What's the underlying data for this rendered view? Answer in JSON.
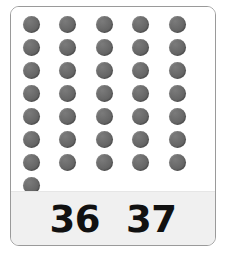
{
  "card": {
    "border_color": "#9a9a9a",
    "background_color": "#ffffff"
  },
  "dot_grid": {
    "dot_color": "#6c6c6c",
    "columns": 5,
    "rows": 8,
    "total_dots": 36,
    "rows_data": [
      [
        1,
        1,
        1,
        1,
        1
      ],
      [
        1,
        1,
        1,
        1,
        1
      ],
      [
        1,
        1,
        1,
        1,
        1
      ],
      [
        1,
        1,
        1,
        1,
        1
      ],
      [
        1,
        1,
        1,
        1,
        1
      ],
      [
        1,
        1,
        1,
        1,
        1
      ],
      [
        1,
        1,
        1,
        1,
        1
      ],
      [
        1,
        0,
        0,
        0,
        0
      ]
    ]
  },
  "label_band": {
    "background_color": "#f0f0f0",
    "text_color": "#111111",
    "choices": [
      {
        "value": "36"
      },
      {
        "value": "37"
      }
    ]
  }
}
